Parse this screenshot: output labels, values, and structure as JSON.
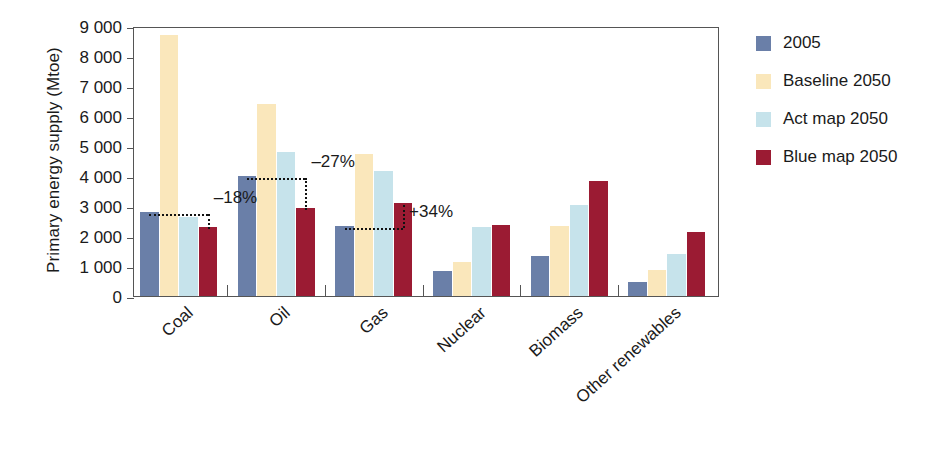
{
  "chart_data": {
    "type": "bar",
    "title": "",
    "xlabel": "",
    "ylabel": "Primary energy supply (Mtoe)",
    "ylim": [
      0,
      9000
    ],
    "ytick_step": 1000,
    "ytick_labels": [
      "9 000",
      "8 000",
      "7 000",
      "6 000",
      "5 000",
      "4 000",
      "3 000",
      "2 000",
      "1 000",
      "0"
    ],
    "grid": false,
    "legend_position": "right",
    "categories": [
      "Coal",
      "Oil",
      "Gas",
      "Nuclear",
      "Biomass",
      "Other renewables"
    ],
    "series": [
      {
        "name": "2005",
        "color": "#6A7FA8",
        "values": [
          2800,
          4000,
          2330,
          850,
          1350,
          480
        ]
      },
      {
        "name": "Baseline 2050",
        "color": "#FAE7BB",
        "values": [
          8700,
          6400,
          4750,
          1150,
          2320,
          870
        ]
      },
      {
        "name": "Act map 2050",
        "color": "#C6E3EB",
        "values": [
          2650,
          4800,
          4180,
          2300,
          3020,
          1400
        ]
      },
      {
        "name": "Blue map 2050",
        "color": "#9B1B33",
        "values": [
          2300,
          2950,
          3100,
          2380,
          3830,
          2130
        ]
      }
    ],
    "annotations": [
      {
        "label": "-18%",
        "category": "Coal",
        "from_series": "2005",
        "to_series": "Blue map 2050",
        "from_value": 2800,
        "to_value": 2300
      },
      {
        "label": "-27%",
        "category": "Oil",
        "from_series": "2005",
        "to_series": "Blue map 2050",
        "from_value": 4000,
        "to_value": 2950
      },
      {
        "label": "+34%",
        "category": "Gas",
        "from_series": "2005",
        "to_series": "Blue map 2050",
        "from_value": 2330,
        "to_value": 3100
      }
    ]
  },
  "legend": {
    "items": [
      {
        "label": "2005"
      },
      {
        "label": "Baseline 2050"
      },
      {
        "label": "Act map 2050"
      },
      {
        "label": "Blue map 2050"
      }
    ]
  },
  "axis": {
    "y_title": "Primary energy supply (Mtoe)"
  }
}
